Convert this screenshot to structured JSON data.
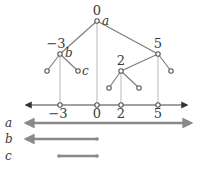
{
  "tree": {
    "root": {
      "label": "0",
      "var": "a",
      "x": 97,
      "y": 21
    },
    "nodes": [
      {
        "id": "n-3",
        "label": "-3",
        "var": "b",
        "x": 60,
        "y": 54
      },
      {
        "id": "n5",
        "label": "5",
        "x": 158,
        "y": 54
      },
      {
        "id": "n2",
        "label": "2",
        "x": 121,
        "y": 71
      }
    ],
    "leaves": [
      {
        "parent": "n-3",
        "x": 47,
        "y": 71
      },
      {
        "parent": "n-3",
        "var": "c",
        "x": 78,
        "y": 71
      },
      {
        "parent": "n5",
        "x": 171,
        "y": 71
      },
      {
        "parent": "n2",
        "x": 109,
        "y": 88
      },
      {
        "parent": "n2",
        "x": 139,
        "y": 88
      }
    ],
    "labels": {
      "root_value": "0",
      "root_var": "a",
      "left_value": "−3",
      "left_var": "b",
      "left_leaf_var": "c",
      "right_value": "5",
      "mid_value": "2"
    }
  },
  "number_line": {
    "ticks": [
      {
        "value": -3,
        "label": "−3",
        "x": 60
      },
      {
        "value": 0,
        "label": "0",
        "x": 97
      },
      {
        "value": 2,
        "label": "2",
        "x": 121
      },
      {
        "value": 5,
        "label": "5",
        "x": 158
      }
    ],
    "y": 105,
    "left_end": 23,
    "right_end": 190
  },
  "intervals": [
    {
      "name": "a",
      "label": "a",
      "description": "(-∞, +∞)",
      "from": "-inf",
      "to": "+inf",
      "y": 123
    },
    {
      "name": "b",
      "label": "b",
      "description": "(-∞, 0]",
      "from": "-inf",
      "to": 0,
      "y": 139
    },
    {
      "name": "c",
      "label": "c",
      "description": "[-3, 0]",
      "from": -3,
      "to": 0,
      "y": 156
    }
  ],
  "colors": {
    "text": "#3a3a3a",
    "edge": "#7a7a7a",
    "drop_line": "#b8b8b8",
    "axis": "#444444",
    "interval": "#8a8a8a",
    "background": "#ffffff"
  }
}
